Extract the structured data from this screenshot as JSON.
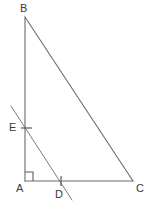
{
  "figure": {
    "background_color": "#ffffff",
    "line_color": "#6b6b6b",
    "label_color": "#3a3a3a",
    "labels": {
      "b": "B",
      "a": "A",
      "c": "C",
      "d": "D",
      "e": "E"
    },
    "marks": {
      "right_angle_at": "A",
      "tick_at_e": "single-tick",
      "tick_at_d": "single-tick"
    },
    "points": {
      "B": {
        "x": 25,
        "y": 17
      },
      "A": {
        "x": 25,
        "y": 181
      },
      "C": {
        "x": 133,
        "y": 181
      },
      "E": {
        "x": 25,
        "y": 128
      },
      "D": {
        "x": 61,
        "y": 181
      }
    },
    "segments": [
      {
        "name": "AB",
        "from": "A",
        "to": "B"
      },
      {
        "name": "AC",
        "from": "A",
        "to": "C"
      },
      {
        "name": "BC",
        "from": "B",
        "to": "C"
      },
      {
        "name": "ED-extended",
        "from": "(11,106)",
        "to": "(72,200)"
      }
    ]
  }
}
